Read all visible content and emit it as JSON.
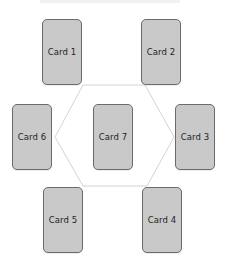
{
  "diagram": {
    "layout": "hexagon",
    "colors": {
      "card_fill": "#c9c9c9",
      "card_border": "#6b6b6b",
      "connector": "#d4d4d4",
      "background": "#ffffff"
    },
    "cards": [
      {
        "id": 1,
        "label": "Card 1",
        "x": 42,
        "y": 19
      },
      {
        "id": 2,
        "label": "Card 2",
        "x": 141,
        "y": 19
      },
      {
        "id": 3,
        "label": "Card 3",
        "x": 175,
        "y": 104
      },
      {
        "id": 4,
        "label": "Card 4",
        "x": 142,
        "y": 187
      },
      {
        "id": 5,
        "label": "Card 5",
        "x": 43,
        "y": 187
      },
      {
        "id": 6,
        "label": "Card 6",
        "x": 12,
        "y": 104
      },
      {
        "id": 7,
        "label": "Card 7",
        "x": 93,
        "y": 104
      }
    ],
    "hexagon_points": "83,85 145,85 174,137 147,186 83,186 55,137"
  }
}
